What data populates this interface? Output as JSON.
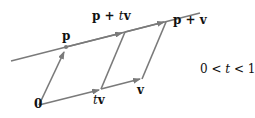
{
  "diagram": {
    "colors": {
      "stroke": "#7a7a7a",
      "text": "#111111",
      "background": "#ffffff"
    },
    "points": {
      "origin": {
        "label": "0",
        "x": 39,
        "y": 105
      },
      "p": {
        "label": "p",
        "x": 66,
        "y": 54
      },
      "p_plus_tv": {
        "label_bold": "p + ",
        "label_t": "t",
        "label_v": "v",
        "x": 125,
        "y": 27
      },
      "tv": {
        "label_t": "t",
        "label_v": "v",
        "x": 101,
        "y": 88
      },
      "v": {
        "label": "v",
        "x": 142,
        "y": 78
      },
      "p_plus_v": {
        "label": "p + v",
        "x": 168,
        "y": 20
      }
    },
    "condition": {
      "pre": "0 < ",
      "t": "t",
      "post": " < 1"
    }
  }
}
